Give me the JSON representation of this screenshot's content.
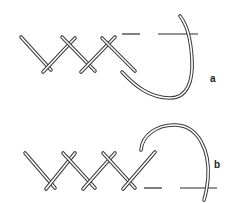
{
  "figure": {
    "panels": [
      {
        "id": "a",
        "label": "a"
      },
      {
        "id": "b",
        "label": "b"
      }
    ],
    "colors": {
      "line": "#3a3a3a",
      "background": "#ffffff"
    }
  }
}
